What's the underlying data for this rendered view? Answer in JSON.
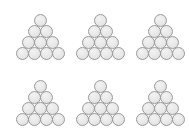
{
  "figure": {
    "background_color": "#ffffff",
    "canvas_width": 189,
    "canvas_height": 136,
    "group_count": 6,
    "grid_rows": 2,
    "grid_columns": 3,
    "circles_per_group": 10,
    "rows_per_group": 4,
    "row_counts": [
      1,
      2,
      3,
      4
    ],
    "circle_fill_color": "#eaeaea",
    "circle_stroke_color": "#9a9a9a",
    "circle_diameter_px": 13,
    "groups": [
      {
        "id": "group-1",
        "position": "top-left",
        "left": 10,
        "top": 14,
        "circle_count": 10,
        "rows": [
          1,
          2,
          3,
          4
        ]
      },
      {
        "id": "group-2",
        "position": "top-center",
        "left": 70,
        "top": 14,
        "circle_count": 10,
        "rows": [
          1,
          2,
          3,
          4
        ]
      },
      {
        "id": "group-3",
        "position": "top-right",
        "left": 130,
        "top": 14,
        "circle_count": 10,
        "rows": [
          1,
          2,
          3,
          4
        ]
      },
      {
        "id": "group-4",
        "position": "bottom-left",
        "left": 10,
        "top": 80,
        "circle_count": 10,
        "rows": [
          1,
          2,
          3,
          4
        ]
      },
      {
        "id": "group-5",
        "position": "bottom-center",
        "left": 70,
        "top": 80,
        "circle_count": 10,
        "rows": [
          1,
          2,
          3,
          4
        ]
      },
      {
        "id": "group-6",
        "position": "bottom-right",
        "left": 130,
        "top": 80,
        "circle_count": 10,
        "rows": [
          1,
          2,
          3,
          4
        ]
      }
    ]
  }
}
